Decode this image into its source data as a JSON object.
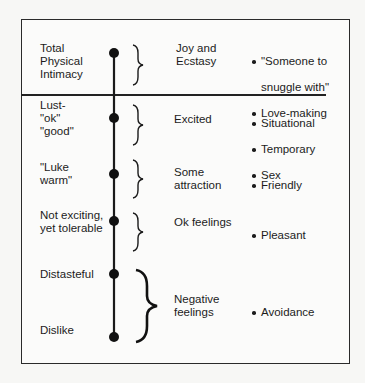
{
  "diagram": {
    "type": "intimacy-scale",
    "colors": {
      "background": "#f7f7f5",
      "ink": "#1c1c1c",
      "border": "#2a2a2a"
    },
    "levels": [
      {
        "label": "Total\nPhysical\nIntimacy",
        "feeling": "Joy and\nEcstasy",
        "examples": [
          {
            "text": "\"Someone to",
            "bullet": true
          },
          {
            "text": "snuggle with\"",
            "bullet": false
          },
          {
            "text": "Love-making",
            "bullet": true
          }
        ]
      },
      {
        "label": "Lust-\n\"ok\"\n\"good\"",
        "feeling": "Excited",
        "examples": [
          {
            "text": "Situational",
            "bullet": true
          },
          {
            "text": "Temporary",
            "bullet": true
          },
          {
            "text": "Sex",
            "bullet": true
          }
        ]
      },
      {
        "label": "\"Luke\nwarm\"",
        "feeling": "Some\nattraction",
        "examples": [
          {
            "text": "Friendly",
            "bullet": true
          }
        ]
      },
      {
        "label": "Not exciting,\nyet tolerable",
        "feeling": "Ok feelings",
        "examples": [
          {
            "text": "Pleasant",
            "bullet": true
          }
        ]
      },
      {
        "label": "Distasteful",
        "feeling": "Negative\nfeelings",
        "examples": [
          {
            "text": "Avoidance",
            "bullet": true
          }
        ]
      },
      {
        "label": "Dislike"
      }
    ]
  }
}
